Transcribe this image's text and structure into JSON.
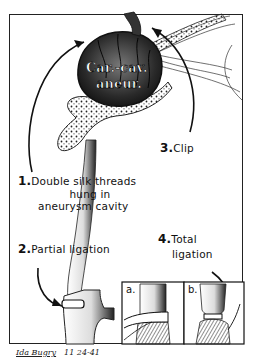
{
  "illustration": {
    "center_label_line1": "Car.-cav.",
    "center_label_line2": "aneur.",
    "steps": [
      {
        "number": "1.",
        "text_line1": "Double silk threads",
        "text_line2": "hung in",
        "text_line3": "aneurysm cavity"
      },
      {
        "number": "2.",
        "text_line1": "Partial ligation"
      },
      {
        "number": "3.",
        "text_line1": "Clip"
      },
      {
        "number": "4.",
        "text_line1": "Total",
        "text_line2": "ligation"
      }
    ],
    "insets": [
      {
        "label": "a."
      },
      {
        "label": "b."
      }
    ],
    "signature": {
      "name": "Ida Bugry",
      "date": "11 24-41"
    }
  },
  "colors": {
    "ink": "#111111",
    "paper": "#ffffff",
    "stipple": "#333333"
  }
}
